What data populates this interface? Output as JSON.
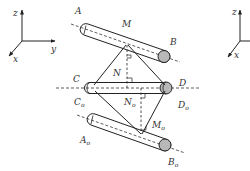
{
  "figure": {
    "type": "geometric diagram of three parallel-offset cylinders with rhombus linkage",
    "colors": {
      "stroke": "#222222",
      "cap_fill": "#b8b8b8",
      "label": "#333333",
      "background": "#ffffff"
    }
  },
  "axes_left": {
    "z_label": "z",
    "y_label": "y",
    "x_label": "x"
  },
  "axes_right": {
    "z_label": "z",
    "x_label": "x"
  },
  "points": {
    "A": "A",
    "M": "M",
    "B": "B",
    "N": "N",
    "C": "C",
    "D": "D",
    "C0": "C",
    "N0": "N",
    "D0": "D",
    "M0": "M",
    "A0": "A",
    "B0": "B",
    "subscript": "o"
  }
}
